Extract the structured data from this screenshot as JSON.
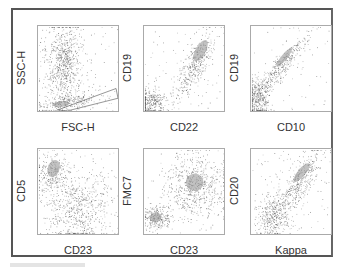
{
  "figure": {
    "border_color": "#555555",
    "dot_color": "#555555",
    "dense_color": "#9a9a9a"
  },
  "chart_data": [
    {
      "type": "scatter",
      "title": "",
      "xlabel": "FSC-H",
      "ylabel": "SSC-H",
      "grid": false,
      "annotations": [
        "gate: lymphocyte region (polygon, lower band)"
      ],
      "populations": [
        {
          "name": "granulocytes/debris",
          "x_center": 0.3,
          "y_center": 0.6,
          "spread": "broad vertical"
        },
        {
          "name": "lymphocytes (gated)",
          "x_center": 0.35,
          "y_center": 0.08,
          "spread": "horizontal band"
        }
      ]
    },
    {
      "type": "scatter",
      "title": "",
      "xlabel": "CD22",
      "ylabel": "CD19",
      "grid": false,
      "populations": [
        {
          "name": "negative",
          "x_center": 0.12,
          "y_center": 0.1
        },
        {
          "name": "CD19+CD22+",
          "x_center": 0.75,
          "y_center": 0.65,
          "shape": "diagonal"
        }
      ]
    },
    {
      "type": "scatter",
      "title": "",
      "xlabel": "CD10",
      "ylabel": "CD19",
      "grid": false,
      "populations": [
        {
          "name": "negative",
          "x_center": 0.08,
          "y_center": 0.12
        },
        {
          "name": "CD19+CD10 dim",
          "x_center": 0.45,
          "y_center": 0.6,
          "shape": "diagonal streak"
        }
      ]
    },
    {
      "type": "scatter",
      "title": "",
      "xlabel": "CD23",
      "ylabel": "CD5",
      "grid": false,
      "populations": [
        {
          "name": "CD5+ (T cells)",
          "x_center": 0.15,
          "y_center": 0.75
        },
        {
          "name": "CD23+ cluster",
          "x_center": 0.45,
          "y_center": 0.25
        }
      ]
    },
    {
      "type": "scatter",
      "title": "",
      "xlabel": "CD23",
      "ylabel": "FMC7",
      "grid": false,
      "populations": [
        {
          "name": "negative",
          "x_center": 0.15,
          "y_center": 0.22
        },
        {
          "name": "FMC7+CD23+",
          "x_center": 0.65,
          "y_center": 0.6
        }
      ]
    },
    {
      "type": "scatter",
      "title": "",
      "xlabel": "Kappa",
      "ylabel": "CD20",
      "grid": false,
      "populations": [
        {
          "name": "negative",
          "x_center": 0.25,
          "y_center": 0.15
        },
        {
          "name": "CD20+ kappa+",
          "x_center": 0.65,
          "y_center": 0.65,
          "shape": "diagonal"
        }
      ]
    }
  ],
  "panels": [
    {
      "xlabel": "FSC-H",
      "ylabel": "SSC-H"
    },
    {
      "xlabel": "CD22",
      "ylabel": "CD19"
    },
    {
      "xlabel": "CD10",
      "ylabel": "CD19"
    },
    {
      "xlabel": "CD23",
      "ylabel": "CD5"
    },
    {
      "xlabel": "CD23",
      "ylabel": "FMC7"
    },
    {
      "xlabel": "Kappa",
      "ylabel": "CD20"
    }
  ]
}
